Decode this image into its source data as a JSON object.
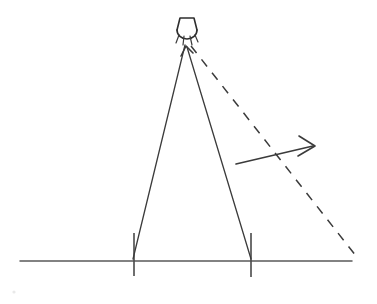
{
  "figure": {
    "background_color": "#ffffff",
    "ink_color": "#3b3b3b",
    "width": 377,
    "height": 304
  },
  "lamp": {
    "name": "street-lamp",
    "shade_points": "177,30 180,18 194,18 197,30",
    "bulb_path": "M177,30 A10,9 0 0 0 197,30",
    "base_x": 187,
    "base_y": 31,
    "glow_rays": [
      "M179,35 L176,43",
      "M184,36 L183,45",
      "M190,36 L192,45",
      "M195,35 L198,42"
    ]
  },
  "rays": {
    "left_ray": {
      "label": "left shadow boundary",
      "path": "M185,45 L133,259"
    },
    "right_ray": {
      "label": "right shadow boundary with arrow",
      "path": "M187,47 L251,259"
    },
    "right_ray_arrow_head": "M181,56 L186,46 L193,53"
  },
  "dashed_ray": {
    "label": "moving shadow boundary",
    "path": "M191,46 L356,256"
  },
  "ground": {
    "label": "ground line",
    "path": "M20,261 L352,261"
  },
  "posts": [
    {
      "name": "left-post-tick",
      "path": "M134,233 L134,276"
    },
    {
      "name": "right-post-tick",
      "path": "M251,233 L251,277"
    }
  ],
  "motion_arrow": {
    "label": "direction of shadow motion",
    "shaft": "M236,164 L313,146",
    "head": "M299,136 L315,146 L298,156"
  },
  "speck": {
    "cx": 14,
    "cy": 292,
    "r": 1.6
  }
}
